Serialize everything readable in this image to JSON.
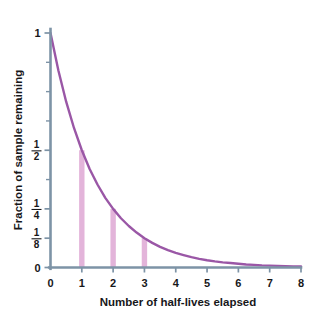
{
  "chart_data": {
    "type": "line",
    "title": "",
    "xlabel": "Number of half-lives elapsed",
    "ylabel": "Fraction of sample remaining",
    "xlim": [
      0,
      8
    ],
    "ylim": [
      0,
      1
    ],
    "grid": false,
    "legend": "none",
    "x_ticks": [
      "0",
      "1",
      "2",
      "3",
      "4",
      "5",
      "6",
      "7",
      "8"
    ],
    "x_tick_values": [
      0,
      1,
      2,
      3,
      4,
      5,
      6,
      7,
      8
    ],
    "y_ticks": [
      {
        "value": 1,
        "label": "1",
        "kind": "plain"
      },
      {
        "value": 0.875,
        "label": "",
        "kind": "minor"
      },
      {
        "value": 0.75,
        "label": "",
        "kind": "minor"
      },
      {
        "value": 0.625,
        "label": "",
        "kind": "minor"
      },
      {
        "value": 0.5,
        "label": "1/2",
        "kind": "fraction",
        "numerator": "1",
        "denominator": "2"
      },
      {
        "value": 0.375,
        "label": "",
        "kind": "minor"
      },
      {
        "value": 0.25,
        "label": "1/4",
        "kind": "fraction",
        "numerator": "1",
        "denominator": "4"
      },
      {
        "value": 0.125,
        "label": "1/8",
        "kind": "fraction",
        "numerator": "1",
        "denominator": "8"
      },
      {
        "value": 0,
        "label": "0",
        "kind": "plain"
      }
    ],
    "series": [
      {
        "name": "Fraction remaining",
        "equation": "y = (1/2)^x",
        "color": "#9a57a6",
        "x": [
          0,
          0.25,
          0.5,
          0.75,
          1,
          1.25,
          1.5,
          1.75,
          2,
          2.25,
          2.5,
          2.75,
          3,
          3.25,
          3.5,
          3.75,
          4,
          4.25,
          4.5,
          4.75,
          5,
          5.25,
          5.5,
          5.75,
          6,
          6.25,
          6.5,
          6.75,
          7,
          7.25,
          7.5,
          7.75,
          8
        ],
        "values": [
          1,
          0.841,
          0.707,
          0.595,
          0.5,
          0.42,
          0.354,
          0.297,
          0.25,
          0.21,
          0.177,
          0.149,
          0.125,
          0.105,
          0.088,
          0.074,
          0.0625,
          0.053,
          0.044,
          0.037,
          0.031,
          0.026,
          0.022,
          0.019,
          0.016,
          0.013,
          0.011,
          0.009,
          0.008,
          0.007,
          0.006,
          0.005,
          0.004
        ]
      }
    ],
    "markers": {
      "name": "half-life drop bars",
      "color": "#e3b4da",
      "points": [
        {
          "x": 1,
          "y": 0.5
        },
        {
          "x": 2,
          "y": 0.25
        },
        {
          "x": 3,
          "y": 0.125
        }
      ]
    },
    "axis_color": "#7d93a6",
    "background": "#ffffff"
  }
}
